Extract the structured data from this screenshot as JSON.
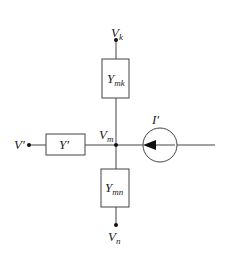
{
  "diagram": {
    "nodes": {
      "top": {
        "label": "V",
        "sub": "k"
      },
      "center": {
        "label": "V",
        "sub": "m"
      },
      "left": {
        "label": "V′"
      },
      "bottom": {
        "label": "V",
        "sub": "n"
      }
    },
    "elements": {
      "admittance_top": {
        "label": "Y",
        "sub": "mk"
      },
      "admittance_left": {
        "label": "Y′"
      },
      "admittance_bottom": {
        "label": "Y",
        "sub": "mn"
      },
      "current_source": {
        "label": "I′",
        "direction": "left"
      }
    },
    "colors": {
      "line": "#444444",
      "text": "#222222"
    }
  }
}
